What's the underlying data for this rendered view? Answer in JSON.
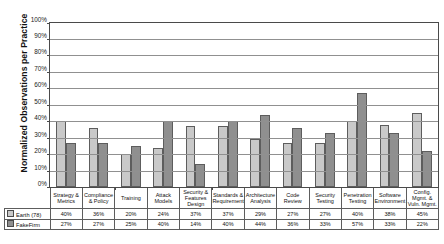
{
  "chart_data": {
    "type": "bar",
    "title": "",
    "subtitle": "",
    "xlabel": "",
    "ylabel": "Normalized Observations per Practice",
    "ylim": [
      0,
      100
    ],
    "ytick_labels": [
      "100%",
      "90%",
      "80%",
      "70%",
      "60%",
      "50%",
      "40%",
      "30%",
      "20%",
      "10%",
      "0%"
    ],
    "ytick_values": [
      100,
      90,
      80,
      70,
      60,
      50,
      40,
      30,
      20,
      10,
      0
    ],
    "grid": true,
    "legend_position": "table-left",
    "categories": [
      "Strategy & Metrics",
      "Compliance & Policy",
      "Training",
      "Attack Models",
      "Security & Features Design",
      "Standards & Requirements",
      "Architecture Analysis",
      "Code Review",
      "Security Testing",
      "Penetration Testing",
      "Software Environment",
      "Config. Mgmt. & Vuln. Mgmt."
    ],
    "category_lines": [
      [
        "Strategy &",
        "Metrics"
      ],
      [
        "Compliance",
        "& Policy"
      ],
      [
        "Training"
      ],
      [
        "Attack",
        "Models"
      ],
      [
        "Security &",
        "Features",
        "Design"
      ],
      [
        "Standards &",
        "Requirements"
      ],
      [
        "Architecture",
        "Analysis"
      ],
      [
        "Code",
        "Review"
      ],
      [
        "Security",
        "Testing"
      ],
      [
        "Penetration",
        "Testing"
      ],
      [
        "Software",
        "Environment"
      ],
      [
        "Config. Mgmt. &",
        "Vuln. Mgmt."
      ]
    ],
    "series": [
      {
        "name": "Earth (78)",
        "color": "#c9c9c9",
        "values": [
          40,
          36,
          20,
          24,
          37,
          37,
          29,
          27,
          27,
          40,
          38,
          45
        ],
        "labels": [
          "40%",
          "36%",
          "20%",
          "24%",
          "37%",
          "37%",
          "29%",
          "27%",
          "27%",
          "40%",
          "38%",
          "45%"
        ]
      },
      {
        "name": "FakeFirm",
        "color": "#8f8f8f",
        "values": [
          27,
          27,
          25,
          40,
          14,
          40,
          44,
          36,
          33,
          57,
          33,
          22
        ],
        "labels": [
          "27%",
          "27%",
          "25%",
          "40%",
          "14%",
          "40%",
          "44%",
          "36%",
          "33%",
          "57%",
          "33%",
          "22%"
        ]
      }
    ]
  }
}
